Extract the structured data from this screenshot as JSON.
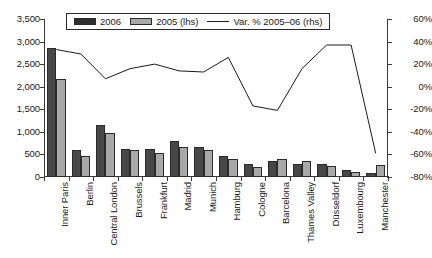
{
  "chart_data": {
    "type": "bar",
    "title": "",
    "subtitle": "",
    "xlabel": "",
    "ylabel": "",
    "grid": false,
    "legend_position": "top-center",
    "categories": [
      "Inner Paris",
      "Berlin",
      "Central London",
      "Brussels",
      "Frankfurt",
      "Madrid",
      "Munich",
      "Hamburg",
      "Cologne",
      "Barcelona",
      "Thames Valley",
      "Düsseldorf",
      "Luxembourg",
      "Manchester"
    ],
    "series": [
      {
        "name": "2006",
        "axis": "left",
        "type": "bar",
        "color": "#474747",
        "values": [
          2850,
          590,
          1160,
          625,
          620,
          800,
          675,
          460,
          295,
          350,
          285,
          280,
          155,
          100
        ]
      },
      {
        "name": "2005 (lhs)",
        "axis": "left",
        "type": "bar",
        "color": "#a8a8a8",
        "values": [
          2170,
          455,
          975,
          605,
          535,
          660,
          590,
          410,
          225,
          405,
          345,
          245,
          105,
          270
        ]
      },
      {
        "name": "Var. % 2005–06 (rhs)",
        "axis": "right",
        "type": "line",
        "color": "#1a1a1a",
        "values": [
          33,
          29,
          7,
          16,
          20,
          14,
          13,
          26,
          -17,
          -21,
          16,
          37,
          37,
          -59
        ]
      }
    ],
    "left_axis": {
      "ticks": [
        "3,500",
        "3,000",
        "2,500",
        "2,000",
        "1,500",
        "1,000",
        "500",
        "0"
      ],
      "min": 0,
      "max": 3500,
      "step": 500
    },
    "right_axis": {
      "ticks": [
        "60%",
        "40%",
        "20%",
        "0%",
        "-20%",
        "-40%",
        "-60%",
        "-80%"
      ],
      "min": -80,
      "max": 60,
      "step": 20
    },
    "legend": [
      {
        "label": "2006",
        "marker": "box-dark"
      },
      {
        "label": "2005 (lhs)",
        "marker": "box-light"
      },
      {
        "label": "Var. % 2005–06 (rhs)",
        "marker": "line"
      }
    ],
    "colors": {
      "bar_2006": "#474747",
      "bar_2005": "#a8a8a8",
      "line": "#1a1a1a",
      "axis": "#3a3a3a",
      "background": "#ffffff"
    }
  }
}
